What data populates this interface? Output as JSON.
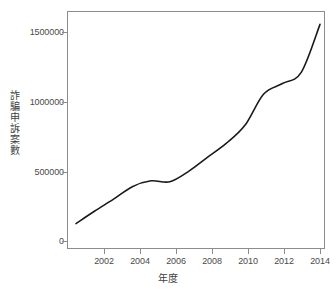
{
  "chart_data": {
    "type": "line",
    "title": "",
    "subtitle": "",
    "xlabel": "年度",
    "ylabel": "詐騙申訴案數",
    "x": [
      2001,
      2002,
      2003,
      2004,
      2005,
      2006,
      2007,
      2008,
      2009,
      2010,
      2011,
      2012,
      2013,
      2014
    ],
    "values": [
      125000,
      215000,
      300000,
      390000,
      432000,
      425000,
      500000,
      600000,
      700000,
      830000,
      1055000,
      1130000,
      1210000,
      1555000
    ],
    "series": [
      {
        "name": "詐騙申訴案數",
        "values": [
          125000,
          215000,
          300000,
          390000,
          432000,
          425000,
          500000,
          600000,
          700000,
          830000,
          1055000,
          1130000,
          1210000,
          1555000
        ],
        "color": "#1a1a1a"
      }
    ],
    "xlim": [
      2001,
      2014
    ],
    "ylim": [
      0,
      1600000
    ],
    "xticks": [
      2002,
      2004,
      2006,
      2008,
      2010,
      2012,
      2014
    ],
    "xticklabels": [
      "2002",
      "2004",
      "2006",
      "2008",
      "2010",
      "2012",
      "2014"
    ],
    "yticks": [
      0,
      500000,
      1000000,
      1500000
    ],
    "yticklabels": [
      "0",
      "500000",
      "1000000",
      "1500000"
    ],
    "grid": false,
    "legend": false,
    "legend_position": "none",
    "line_width": 1.6,
    "marker": "none",
    "smoothing": "spline",
    "background_color": "#ffffff",
    "axis_color": "#8c8c8c",
    "text_color": "#3f3f3f"
  }
}
